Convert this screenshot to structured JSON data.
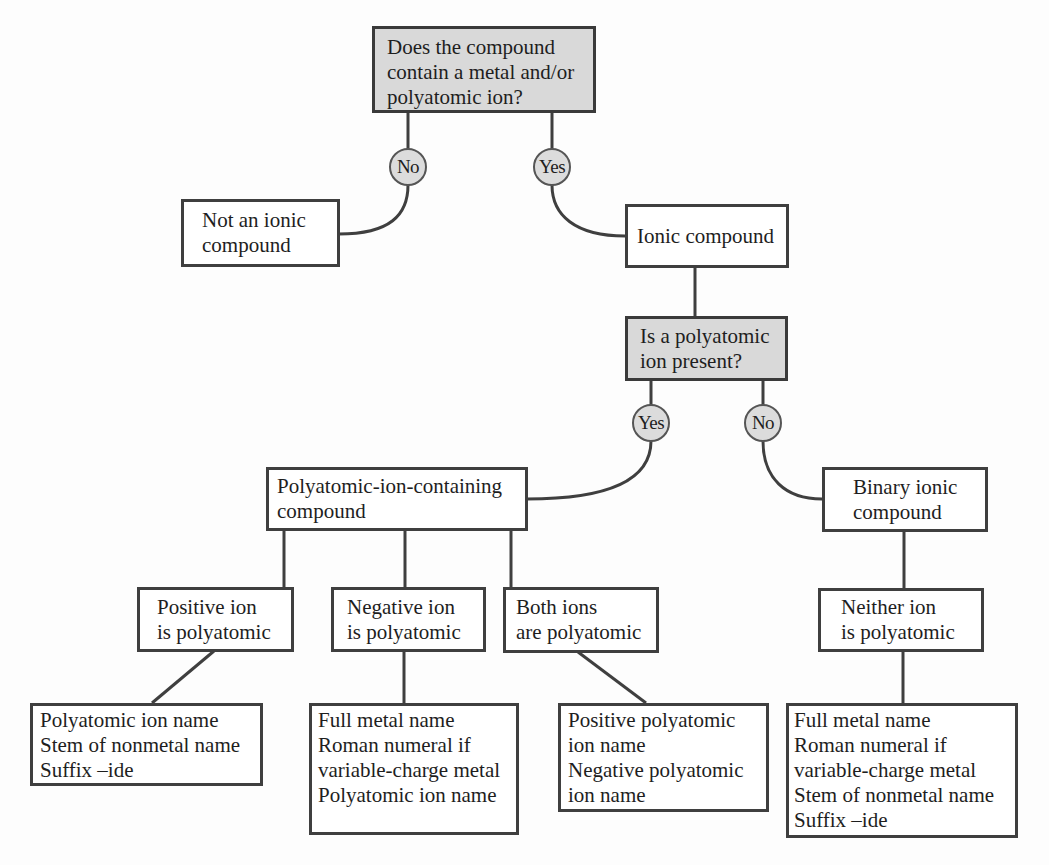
{
  "diagram": {
    "type": "flowchart",
    "colors": {
      "decision_fill": "#d9d9d9",
      "node_fill": "#ffffff",
      "border": "#3f3f3f",
      "badge_fill": "#dcdcdc"
    },
    "q1": {
      "lines": [
        "Does the compound",
        "contain a metal and/or",
        "polyatomic ion?"
      ],
      "no_label": "No",
      "yes_label": "Yes"
    },
    "not_ionic": {
      "lines": [
        "Not an ionic",
        "compound"
      ]
    },
    "ionic": {
      "lines": [
        "Ionic compound"
      ]
    },
    "q2": {
      "lines": [
        "Is a polyatomic",
        "ion present?"
      ],
      "yes_label": "Yes",
      "no_label": "No"
    },
    "poly_compound": {
      "lines": [
        "Polyatomic-ion-containing",
        "compound"
      ]
    },
    "binary_compound": {
      "lines": [
        "Binary ionic",
        "compound"
      ]
    },
    "positive_poly": {
      "lines": [
        "Positive ion",
        "is polyatomic"
      ],
      "rules": [
        "Polyatomic ion name",
        "Stem of nonmetal name",
        "Suffix –ide"
      ]
    },
    "negative_poly": {
      "lines": [
        "Negative ion",
        "is polyatomic"
      ],
      "rules": [
        "Full metal name",
        "Roman numeral if",
        "variable-charge metal",
        "Polyatomic ion name"
      ]
    },
    "both_poly": {
      "lines": [
        "Both ions",
        "are polyatomic"
      ],
      "rules": [
        "Positive polyatomic",
        "ion name",
        "Negative polyatomic",
        "ion name"
      ]
    },
    "neither_poly": {
      "lines": [
        "Neither ion",
        "is polyatomic"
      ],
      "rules": [
        "Full metal name",
        "Roman numeral if",
        "variable-charge metal",
        "Stem of nonmetal name",
        "Suffix –ide"
      ]
    }
  }
}
